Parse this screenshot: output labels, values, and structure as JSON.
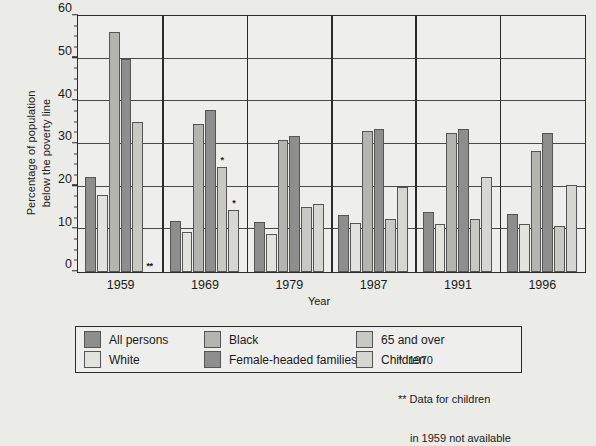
{
  "chart_data": {
    "type": "bar",
    "title": "",
    "xlabel": "Year",
    "ylabel": "Percentage of population below the poverty line",
    "ylabel_line1": "Percentage of population",
    "ylabel_line2": "below the poverty line",
    "ylim": [
      0,
      60
    ],
    "ytick_step": 10,
    "yticks": [
      "0",
      "10",
      "20",
      "30",
      "40",
      "50",
      "60"
    ],
    "grid": "horizontal",
    "legend_position": "below-plot",
    "categories": [
      "1959",
      "1969",
      "1979",
      "1987",
      "1991",
      "1996"
    ],
    "series": [
      {
        "name": "All persons",
        "color": "#8e8e8e",
        "values": [
          22.4,
          12.1,
          11.7,
          13.5,
          14.2,
          13.7
        ],
        "notes": [
          "",
          "",
          "",
          "",
          "",
          ""
        ]
      },
      {
        "name": "White",
        "color": "#e2e2de",
        "values": [
          18.1,
          9.5,
          9.0,
          11.5,
          11.3,
          11.2
        ],
        "notes": [
          "",
          "",
          "",
          "",
          "",
          ""
        ]
      },
      {
        "name": "Black",
        "color": "#b4b4b0",
        "values": [
          56.5,
          34.9,
          31.0,
          33.1,
          32.7,
          28.4
        ],
        "notes": [
          "",
          "",
          "",
          "",
          "",
          ""
        ]
      },
      {
        "name": "Female-headed families",
        "color": "#8e8e8e",
        "values": [
          50.2,
          38.2,
          32.0,
          33.6,
          33.6,
          32.6
        ],
        "notes": [
          "",
          "",
          "",
          "",
          "",
          ""
        ]
      },
      {
        "name": "65 and over",
        "color": "#c8c8c4",
        "values": [
          35.2,
          24.6,
          15.2,
          12.5,
          12.4,
          10.8
        ],
        "notes": [
          "",
          "*",
          "",
          "",
          "",
          ""
        ]
      },
      {
        "name": "Children",
        "color": "#d6d6d2",
        "values": [
          null,
          14.7,
          16.0,
          20.0,
          22.4,
          20.5
        ],
        "notes": [
          "**",
          "*",
          "",
          "",
          "",
          ""
        ]
      }
    ]
  },
  "legend": {
    "entries": [
      {
        "label": "All persons",
        "color": "#8e8e8e"
      },
      {
        "label": "White",
        "color": "#e2e2de"
      },
      {
        "label": "Black",
        "color": "#b4b4b0"
      },
      {
        "label": "Female-headed families",
        "color": "#8e8e8e"
      },
      {
        "label": "65 and over",
        "color": "#c8c8c4"
      },
      {
        "label": "Children",
        "color": "#d6d6d2"
      }
    ]
  },
  "footnotes": {
    "single_star": "*  1970",
    "double_star_line1": "** Data for children",
    "double_star_line2": "in 1959 not available"
  },
  "colors": {
    "background": "#ebebe8",
    "plot_background": "#eeeeec",
    "axis": "#2b2b2b",
    "grid": "#4a4a4a",
    "text": "#1a1a1a"
  }
}
